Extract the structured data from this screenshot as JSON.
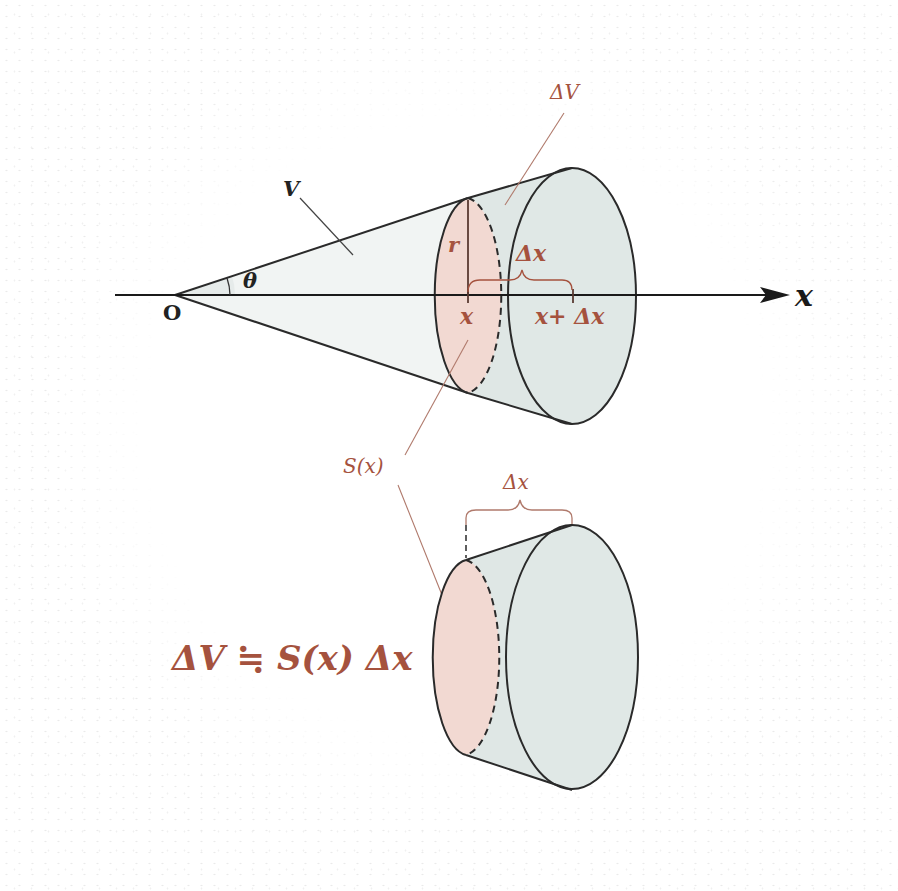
{
  "diagram": {
    "type": "cone-volume-slicing",
    "colors": {
      "accent": "#a5523e",
      "outline": "#2a2a2a",
      "cross_section_fill": "#f1dad3",
      "frustum_fill": "#dde6e4",
      "cone_fill": "#f0f3f2",
      "leader_line": "#b07a6c"
    },
    "top_figure": {
      "origin_label": "O",
      "angle_label": "θ",
      "volume_label": "V",
      "radius_label": "r",
      "axis_label": "x",
      "slice_volume_label": "ΔV",
      "delta_x_label": "Δx",
      "x_tick_label": "x",
      "x_plus_dx_label": "x+ Δx"
    },
    "middle": {
      "cross_section_label": "S(x)"
    },
    "bottom_figure": {
      "delta_x_label": "Δx",
      "formula": "ΔV ≒ S(x) Δx"
    }
  }
}
